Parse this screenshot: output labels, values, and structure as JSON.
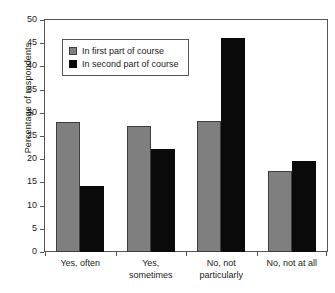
{
  "chart_data": {
    "type": "bar",
    "title": "",
    "xlabel": "",
    "ylabel": "Percentage of respondents",
    "ylim": [
      0,
      50
    ],
    "ytick_step": 5,
    "yticks": [
      50,
      45,
      40,
      35,
      30,
      25,
      20,
      15,
      10,
      5,
      0
    ],
    "grid": false,
    "legend_position": "upper-left-inside",
    "categories": [
      "Yes, often",
      "Yes,\nsometimes",
      "No, not\nparticularly",
      "No, not at all"
    ],
    "category_lines": [
      [
        "Yes, often"
      ],
      [
        "Yes,",
        "sometimes"
      ],
      [
        "No, not",
        "particularly"
      ],
      [
        "No, not at all"
      ]
    ],
    "series": [
      {
        "name": "In first part of course",
        "color": "#7f7f7f",
        "values": [
          28.1,
          27.2,
          28.3,
          17.4
        ]
      },
      {
        "name": "In second part of course",
        "color": "#0a0a0a",
        "values": [
          14.2,
          22.3,
          46.2,
          19.6
        ]
      }
    ]
  },
  "legend": {
    "items": [
      {
        "label": "In first part of course"
      },
      {
        "label": "In second part of course"
      }
    ]
  }
}
